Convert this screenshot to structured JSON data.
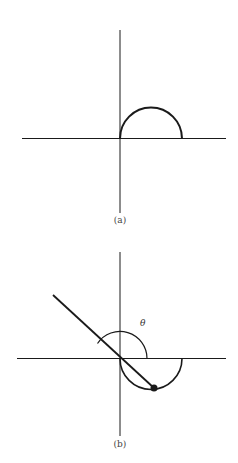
{
  "figure_a": {
    "label": "(a)",
    "description": "Axes with upper semicircle starting at origin"
  },
  "figure_b": {
    "label": "(b)",
    "angle_label": "θ",
    "description": "Axes with lower semicircle, line through origin at angle θ intersecting the semicircle at a point"
  },
  "colors": {
    "stroke": "#1a1a1a",
    "background": "#ffffff"
  }
}
